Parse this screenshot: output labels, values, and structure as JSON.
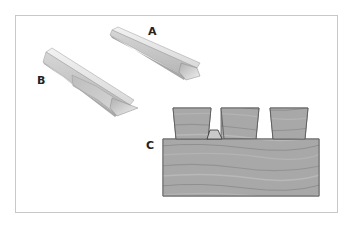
{
  "figure": {
    "labels": {
      "a": "A",
      "b": "B",
      "c": "C"
    },
    "parts": [
      {
        "id": "A",
        "description": "angled prism bar"
      },
      {
        "id": "B",
        "description": "angled prism bar with shaded mid-section"
      },
      {
        "id": "C",
        "description": "wood board with three dovetail tails and a small wedge"
      }
    ],
    "colors": {
      "frame_border": "#c8c8c8",
      "bar_light": "#e8e8e8",
      "bar_mid": "#cfcfcf",
      "bar_dark": "#a9a9a9",
      "wood": "#a6a6a6",
      "wood_grain": "#8e8e8e",
      "outline": "#555555"
    }
  }
}
